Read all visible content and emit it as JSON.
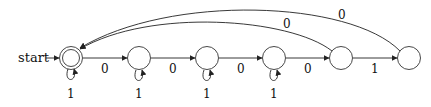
{
  "diagram": {
    "type": "finite-automaton",
    "start_label": "start",
    "states": [
      {
        "id": "q0",
        "cx": 71,
        "cy": 58,
        "accepting": true,
        "self_loop_label": "1"
      },
      {
        "id": "q1",
        "cx": 139,
        "cy": 58,
        "accepting": false,
        "self_loop_label": "1"
      },
      {
        "id": "q2",
        "cx": 207,
        "cy": 58,
        "accepting": false,
        "self_loop_label": "1"
      },
      {
        "id": "q3",
        "cx": 274,
        "cy": 58,
        "accepting": false,
        "self_loop_label": "1"
      },
      {
        "id": "q4",
        "cx": 341,
        "cy": 58,
        "accepting": false,
        "self_loop_label": null
      },
      {
        "id": "q5",
        "cx": 409,
        "cy": 58,
        "accepting": false,
        "self_loop_label": null
      }
    ],
    "transitions": [
      {
        "from": "q0",
        "to": "q1",
        "label": "0"
      },
      {
        "from": "q1",
        "to": "q2",
        "label": "0"
      },
      {
        "from": "q2",
        "to": "q3",
        "label": "0"
      },
      {
        "from": "q3",
        "to": "q4",
        "label": "0"
      },
      {
        "from": "q4",
        "to": "q5",
        "label": "1"
      },
      {
        "from": "q4",
        "to": "q0",
        "label": "0"
      },
      {
        "from": "q5",
        "to": "q0",
        "label": "0"
      }
    ],
    "labels": {
      "e01": "0",
      "e12": "0",
      "e23": "0",
      "e34": "0",
      "e45": "1",
      "back4": "0",
      "back5": "0",
      "loop0": "1",
      "loop1": "1",
      "loop2": "1",
      "loop3": "1"
    }
  }
}
